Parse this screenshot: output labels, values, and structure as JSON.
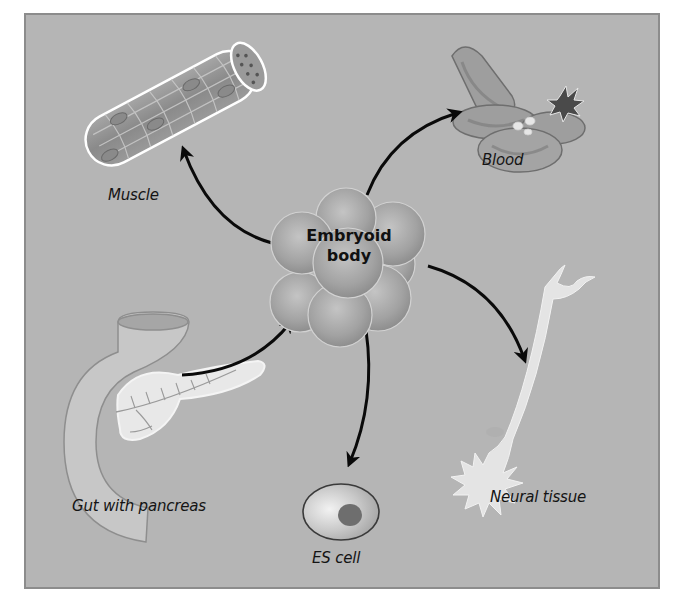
{
  "diagram": {
    "center": {
      "line1": "Embryoid",
      "line2": "body"
    },
    "nodes": [
      {
        "id": "muscle",
        "label": "Muscle",
        "direction": "from-center"
      },
      {
        "id": "blood",
        "label": "Blood",
        "direction": "from-center"
      },
      {
        "id": "neural",
        "label": "Neural tissue",
        "direction": "from-center"
      },
      {
        "id": "es-cell",
        "label": "ES cell",
        "direction": "from-center"
      },
      {
        "id": "gut",
        "label": "Gut with pancreas",
        "direction": "to-center"
      }
    ],
    "colors": {
      "background": "#b5b5b5",
      "border": "#8c8c8c",
      "arrow": "#0a0a0a",
      "cell_fill": "#a8a8a8",
      "light_tissue": "#e6e6e6"
    }
  }
}
